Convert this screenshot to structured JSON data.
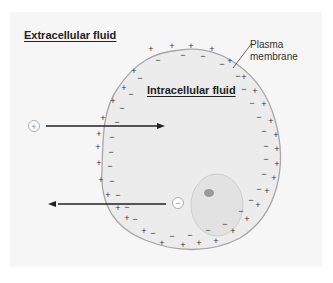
{
  "labels": {
    "extracellular": "Extracellular fluid",
    "intracellular": "Intracellular fluid",
    "membrane_line1": "Plasma",
    "membrane_line2": "membrane"
  },
  "ions": {
    "positive_symbol": "+",
    "negative_symbol": "−"
  },
  "arrows": [
    {
      "direction": "inward",
      "ion": "+"
    },
    {
      "direction": "outward",
      "ion": "−"
    }
  ],
  "colors": {
    "cell_fill": "#ececec",
    "membrane": "#a8a8a8",
    "nucleus": "#e0e0e0",
    "nucleolus": "#9a9a9a",
    "arrow": "#222222"
  }
}
